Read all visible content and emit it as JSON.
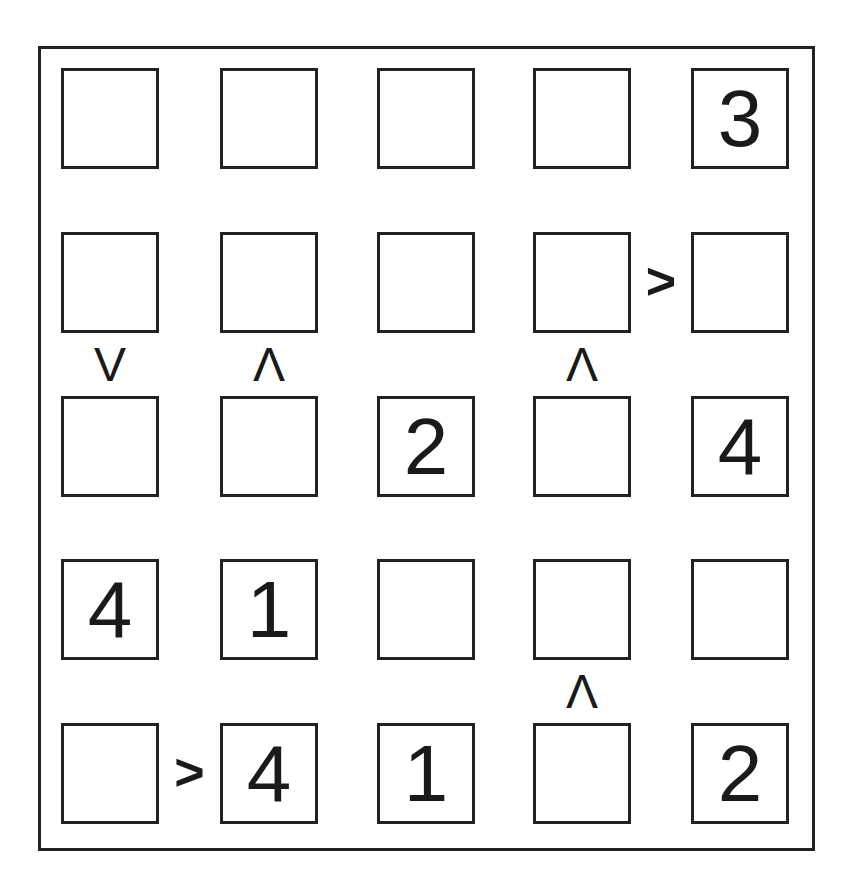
{
  "puzzle": {
    "type": "futoshiki",
    "size": 5,
    "grid": [
      [
        "",
        "",
        "",
        "",
        "3"
      ],
      [
        "",
        "",
        "",
        "",
        ""
      ],
      [
        "",
        "",
        "2",
        "",
        "4"
      ],
      [
        "4",
        "1",
        "",
        "",
        ""
      ],
      [
        "",
        "4",
        "1",
        "",
        "2"
      ]
    ],
    "constraints": [
      {
        "row": 1,
        "col": 3,
        "dir": "right",
        "symbol": ">"
      },
      {
        "row": 1,
        "col": 0,
        "dir": "down",
        "symbol": "V"
      },
      {
        "row": 1,
        "col": 1,
        "dir": "down",
        "symbol": "Λ"
      },
      {
        "row": 1,
        "col": 3,
        "dir": "down",
        "symbol": "Λ"
      },
      {
        "row": 3,
        "col": 3,
        "dir": "down",
        "symbol": "Λ"
      },
      {
        "row": 4,
        "col": 0,
        "dir": "right",
        "symbol": ">"
      }
    ]
  },
  "colors": {
    "line": "#222222",
    "text": "#1a1a1a",
    "background": "#ffffff"
  }
}
